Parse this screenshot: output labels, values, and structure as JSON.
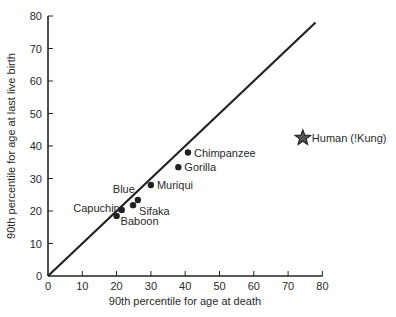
{
  "chart_data": {
    "type": "scatter",
    "title": "",
    "xlabel": "90th percentile for age at death",
    "ylabel": "90th percentile for age at last live birth",
    "xlim": [
      0,
      80
    ],
    "ylim": [
      0,
      80
    ],
    "x_ticks": [
      0,
      10,
      20,
      30,
      40,
      50,
      60,
      70,
      80
    ],
    "y_ticks": [
      0,
      10,
      20,
      30,
      40,
      50,
      60,
      70,
      80
    ],
    "grid": false,
    "reference_line": {
      "label": "y = x",
      "from": [
        0,
        0
      ],
      "to": [
        78,
        78
      ]
    },
    "points": [
      {
        "label": "Baboon",
        "x": 20,
        "y": 18.5,
        "marker": "circle"
      },
      {
        "label": "Capuchin",
        "x": 21.5,
        "y": 20.3,
        "marker": "circle"
      },
      {
        "label": "Sifaka",
        "x": 24.8,
        "y": 21.8,
        "marker": "circle"
      },
      {
        "label": "Blue",
        "x": 26.2,
        "y": 23.4,
        "marker": "circle"
      },
      {
        "label": "Muriqui",
        "x": 30,
        "y": 28,
        "marker": "circle"
      },
      {
        "label": "Gorilla",
        "x": 38,
        "y": 33.5,
        "marker": "circle"
      },
      {
        "label": "Chimpanzee",
        "x": 40.8,
        "y": 38,
        "marker": "circle"
      },
      {
        "label": "Human (!Kung)",
        "x": 74.3,
        "y": 42.5,
        "marker": "star"
      }
    ]
  },
  "colors": {
    "axis": "#222222",
    "point": "#222222",
    "text": "#2a2a2a",
    "star_fill": "#555555"
  }
}
